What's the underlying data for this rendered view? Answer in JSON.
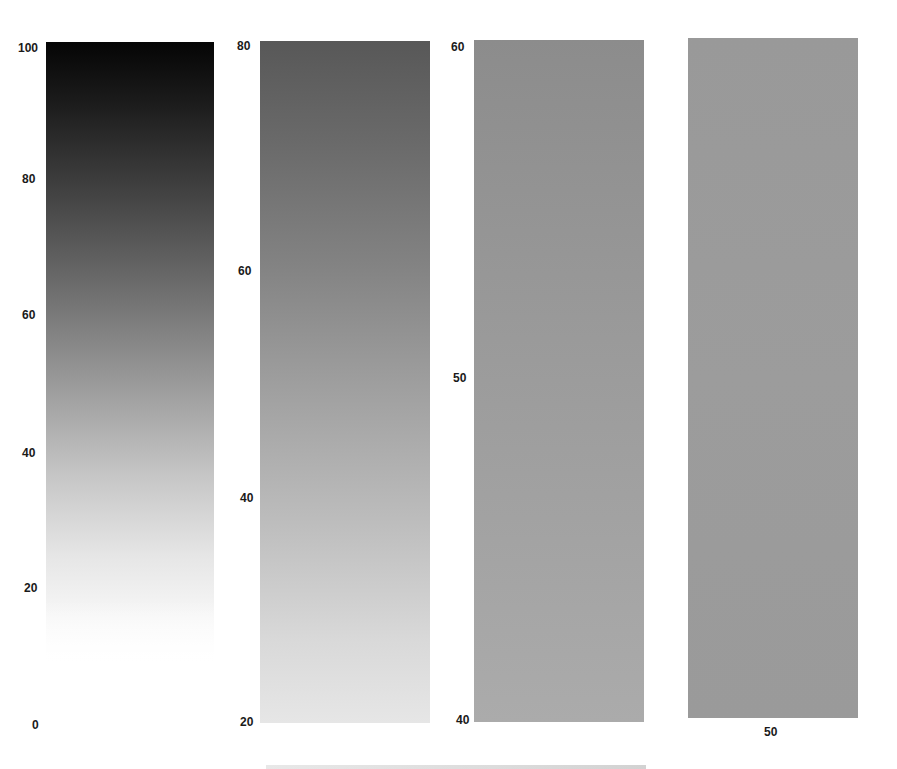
{
  "figure": {
    "strips": [
      {
        "id": "strip-1",
        "range": [
          0,
          100
        ],
        "labels": [
          {
            "text": "100",
            "value": 100
          },
          {
            "text": "80",
            "value": 80
          },
          {
            "text": "60",
            "value": 60
          },
          {
            "text": "40",
            "value": 40
          },
          {
            "text": "20",
            "value": 20
          },
          {
            "text": "0",
            "value": 0
          }
        ],
        "top_color": "#050505",
        "bottom_color": "#ffffff"
      },
      {
        "id": "strip-2",
        "range": [
          20,
          80
        ],
        "labels": [
          {
            "text": "80",
            "value": 80
          },
          {
            "text": "60",
            "value": 60
          },
          {
            "text": "40",
            "value": 40
          },
          {
            "text": "20",
            "value": 20
          }
        ],
        "top_color": "#585858",
        "bottom_color": "#e6e6e6"
      },
      {
        "id": "strip-3",
        "range": [
          40,
          60
        ],
        "labels": [
          {
            "text": "60",
            "value": 60
          },
          {
            "text": "50",
            "value": 50
          },
          {
            "text": "40",
            "value": 40
          }
        ],
        "top_color": "#8c8c8c",
        "bottom_color": "#ababab"
      },
      {
        "id": "strip-4",
        "range": [
          50,
          50
        ],
        "labels": [
          {
            "text": "50",
            "value": 50
          }
        ],
        "top_color": "#999999",
        "bottom_color": "#9a9a9a"
      }
    ]
  }
}
